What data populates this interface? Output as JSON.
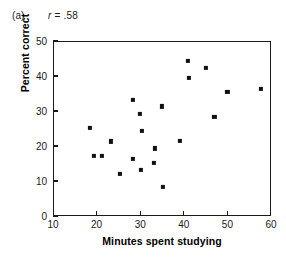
{
  "figure": {
    "panel_label": "(a)",
    "correlation_symbol": "r",
    "correlation_text": " = .58"
  },
  "chart_data": {
    "type": "scatter",
    "title": "",
    "panel": "(a)",
    "annotation": "r = .58",
    "correlation": 0.58,
    "xlabel": "Minutes spent studying",
    "ylabel": "Percent correct",
    "xlim": [
      10,
      60
    ],
    "ylim": [
      0,
      50
    ],
    "xticks": [
      10,
      20,
      30,
      40,
      50,
      60
    ],
    "yticks": [
      0,
      10,
      20,
      30,
      40,
      50
    ],
    "grid": false,
    "legend": null,
    "marker": "square",
    "marker_color": "#111111",
    "points": [
      {
        "x": 18.4,
        "y": 25.2
      },
      {
        "x": 19.4,
        "y": 17.2
      },
      {
        "x": 21.2,
        "y": 17.2
      },
      {
        "x": 23.3,
        "y": 21.3
      },
      {
        "x": 25.3,
        "y": 12.0
      },
      {
        "x": 28.3,
        "y": 33.1
      },
      {
        "x": 28.4,
        "y": 16.2
      },
      {
        "x": 30.0,
        "y": 29.2
      },
      {
        "x": 30.2,
        "y": 13.2
      },
      {
        "x": 30.4,
        "y": 24.2
      },
      {
        "x": 33.2,
        "y": 15.2
      },
      {
        "x": 33.4,
        "y": 19.3
      },
      {
        "x": 35.0,
        "y": 31.3
      },
      {
        "x": 35.2,
        "y": 8.2
      },
      {
        "x": 39.2,
        "y": 21.4
      },
      {
        "x": 41.0,
        "y": 44.2
      },
      {
        "x": 41.1,
        "y": 39.5
      },
      {
        "x": 45.0,
        "y": 42.3
      },
      {
        "x": 47.0,
        "y": 28.3
      },
      {
        "x": 50.0,
        "y": 35.4
      },
      {
        "x": 57.7,
        "y": 36.4
      }
    ]
  }
}
